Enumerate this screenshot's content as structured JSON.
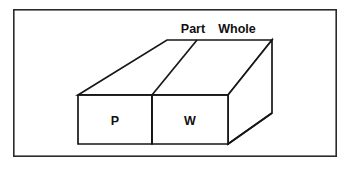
{
  "figure": {
    "frame": {
      "name": "outer-border",
      "x": 13,
      "y": 9,
      "width": 324,
      "height": 148,
      "stroke_color": "#2b2b2b",
      "fill_color": "#ffffff"
    },
    "line_color": "#161616",
    "fill_color": "#ffffff",
    "background_color": "#ffffff",
    "labels": {
      "top_left_label": "Part",
      "top_right_label": "Whole",
      "front_left_label": "P",
      "front_right_label": "W"
    },
    "label_positions": {
      "top_left_label": {
        "x": 193,
        "y": 33
      },
      "top_right_label": {
        "x": 237,
        "y": 33
      },
      "front_left_label": {
        "x": 115,
        "y": 125
      },
      "front_right_label": {
        "x": 190,
        "y": 125
      }
    },
    "geometry": {
      "front_face": {
        "left": 78,
        "top": 95,
        "right": 228,
        "bottom": 144
      },
      "front_divider_x": 152,
      "depth_offset": {
        "dx": 95,
        "dy": -55
      },
      "top_back_edge": {
        "left_x": 167,
        "right_x": 272,
        "y": 40
      },
      "right_face_top_y": 40,
      "right_face_mid_y": 113,
      "top_divider": {
        "x1": 152,
        "y1": 95,
        "x2": 197,
        "y2": 40
      }
    }
  }
}
